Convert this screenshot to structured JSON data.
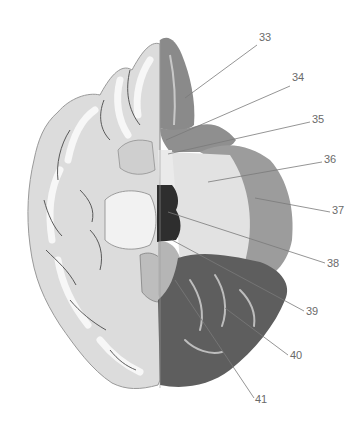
{
  "figure": {
    "colors": {
      "background": "#ffffff",
      "cortex_light": "#d8d8d8",
      "white_matter": "#f4f4f4",
      "sulcus_line": "#4a4a4a",
      "region_medium": "#8a8a8a",
      "region_dark": "#5e5e5e",
      "region_light": "#c4c4c4",
      "region_pale": "#e2e2e2",
      "region_black": "#2e2e2e",
      "leader_line": "#7a7a7a",
      "label_text": "#6a6a6a"
    },
    "labels": [
      {
        "id": "33",
        "text": "33",
        "x": 259,
        "y": 32
      },
      {
        "id": "34",
        "text": "34",
        "x": 292,
        "y": 72
      },
      {
        "id": "35",
        "text": "35",
        "x": 312,
        "y": 114
      },
      {
        "id": "36",
        "text": "36",
        "x": 324,
        "y": 154
      },
      {
        "id": "37",
        "text": "37",
        "x": 332,
        "y": 205
      },
      {
        "id": "38",
        "text": "38",
        "x": 327,
        "y": 258
      },
      {
        "id": "39",
        "text": "39",
        "x": 306,
        "y": 306
      },
      {
        "id": "40",
        "text": "40",
        "x": 290,
        "y": 350
      },
      {
        "id": "41",
        "text": "41",
        "x": 255,
        "y": 394
      }
    ]
  }
}
